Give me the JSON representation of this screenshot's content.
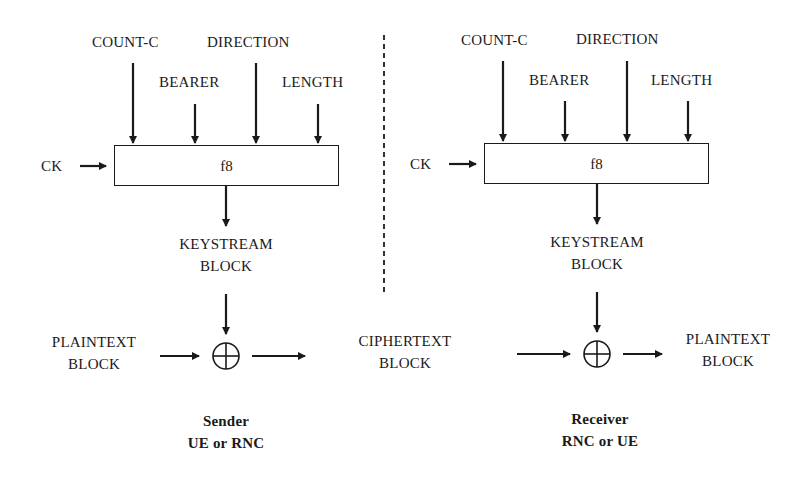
{
  "sender": {
    "inputs": {
      "count_c": "COUNT-C",
      "direction": "DIRECTION",
      "bearer": "BEARER",
      "length": "LENGTH",
      "ck": "CK"
    },
    "function_label": "f8",
    "keystream": [
      "KEYSTREAM",
      "BLOCK"
    ],
    "input_block": [
      "PLAINTEXT",
      "BLOCK"
    ],
    "caption": [
      "Sender",
      "UE or RNC"
    ]
  },
  "channel": {
    "block": [
      "CIPHERTEXT",
      "BLOCK"
    ]
  },
  "receiver": {
    "inputs": {
      "count_c": "COUNT-C",
      "direction": "DIRECTION",
      "bearer": "BEARER",
      "length": "LENGTH",
      "ck": "CK"
    },
    "function_label": "f8",
    "keystream": [
      "KEYSTREAM",
      "BLOCK"
    ],
    "output_block": [
      "PLAINTEXT",
      "BLOCK"
    ],
    "caption": [
      "Receiver",
      "RNC or UE"
    ]
  },
  "symbols": {
    "xor": "xor-circle-plus"
  }
}
